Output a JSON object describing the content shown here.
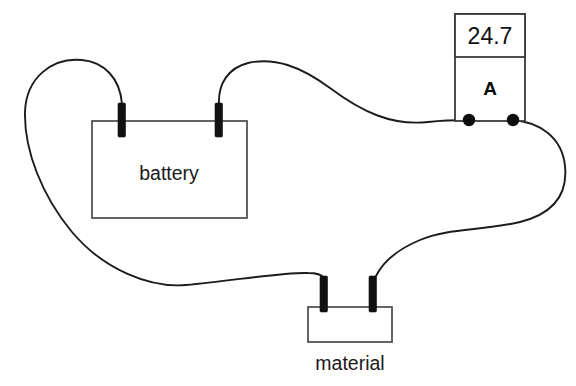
{
  "diagram": {
    "background_color": "#ffffff",
    "wire_color": "#1c1c1c",
    "terminal_color": "#111111"
  },
  "battery": {
    "label": "battery",
    "terminal_left_name": "battery-terminal-left",
    "terminal_right_name": "battery-terminal-right"
  },
  "ammeter": {
    "reading": "24.7",
    "symbol": "A",
    "unit_name": "ampere",
    "terminal_left_name": "ammeter-terminal-left",
    "terminal_right_name": "ammeter-terminal-right"
  },
  "material": {
    "label": "material",
    "terminal_left_name": "material-terminal-left",
    "terminal_right_name": "material-terminal-right"
  },
  "wires": {
    "battery_left_to_material_left": "long left loop",
    "battery_right_to_ammeter_left": "upper arc",
    "ammeter_right_to_material_right": "right s-curve"
  }
}
